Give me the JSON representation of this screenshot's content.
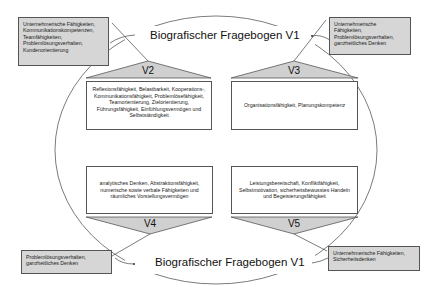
{
  "diagram": {
    "title_top": "Biografischer Fragebogen V1",
    "title_bottom": "Biografischer Fragebogen V1",
    "colors": {
      "gray_box_fill": "#d6d6d6",
      "triangle_fill": "#d0d0d0",
      "line": "#444444",
      "white_box_fill": "#ffffff"
    },
    "corner_boxes": {
      "top_left": "Unternehmerische Fähigkeiten, Kommunikationskompetenzen, Teamfähigkeiten, Problemlösungsverhalten, Kundenorientierung",
      "top_right": "Unternehmerische Fähigkeiten, Problemlösungsverhalten, ganzheitliches Denken",
      "bottom_left": "Problemlösungsverhalten, ganzheitliches Denken",
      "bottom_right": "Unternehmerische Fähigkeiten, Sicherheitsdenken"
    },
    "versions": [
      {
        "label": "V2",
        "text": "Reflexionsfähigkeit, Belastbarkeit, Kooperations-, Kommunikationsfähigkeit, Problemlösefähigkeit, Teamorientierung, Zielorientierung, Führungsfähigkeit, Einfühlungsvermögen und Selbstständigkeit"
      },
      {
        "label": "V3",
        "text": "Organisationsfähigkeit, Planungskompetenz"
      },
      {
        "label": "V4",
        "text": "analytisches Denken, Abstraktionsfähigkeit, numerische sowie verbale Fähigkeiten und räumliches Vorstellungsvermögen"
      },
      {
        "label": "V5",
        "text": "Leistungsbereitschaft, Konfliktfähigkeit, Selbstmotivation, sicherheitsbewusstes Handeln und Begeisterungsfähigkeit"
      }
    ]
  }
}
